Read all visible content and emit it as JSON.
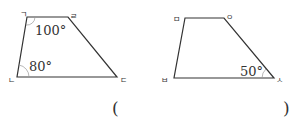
{
  "colors": {
    "stroke": "#333333",
    "arc": "#888888",
    "text": "#333333"
  },
  "figure_left": {
    "vertices": {
      "top_left": {
        "label": "ㄱ"
      },
      "top_right": {
        "label": "ㄹ"
      },
      "bottom_left": {
        "label": "ㄴ"
      },
      "bottom_right": {
        "label": "ㄷ"
      }
    },
    "angles": {
      "top_left": "100°",
      "bottom_left": "80°"
    }
  },
  "figure_right": {
    "vertices": {
      "top_left": {
        "label": "ㅁ"
      },
      "top_right": {
        "label": "ㅇ"
      },
      "bottom_left": {
        "label": "ㅂ"
      },
      "bottom_right": {
        "label": "ㅅ"
      }
    },
    "angles": {
      "bottom_right": "50°"
    }
  },
  "answer": {
    "open": "(",
    "close": ")"
  }
}
